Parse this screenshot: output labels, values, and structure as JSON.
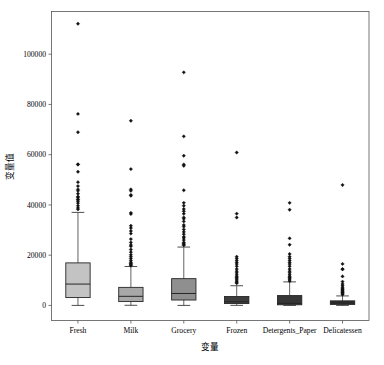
{
  "chart_data": {
    "type": "box",
    "title": "",
    "xlabel": "变量",
    "ylabel": "变量值",
    "grid": false,
    "legend": "none",
    "ylim": [
      -6000,
      117000
    ],
    "yticks": [
      0,
      20000,
      40000,
      60000,
      80000,
      100000
    ],
    "ytick_labels": [
      "0",
      "20000",
      "40000",
      "60000",
      "80000",
      "100000"
    ],
    "categories": [
      "Fresh",
      "Milk",
      "Grocery",
      "Frozen",
      "Detergents_Paper",
      "Delicatessen"
    ],
    "boxes": [
      {
        "name": "Fresh",
        "fill": "#c3c3c3",
        "whisker_low": 3,
        "q1": 3128,
        "median": 8504,
        "q3": 16934,
        "whisker_high": 37036,
        "fliers": [
          112151,
          76237,
          68951,
          56083,
          56159,
          53205,
          49063,
          47493,
          46197,
          45640,
          44466,
          43265,
          43088,
          42312,
          42088,
          41474,
          40721,
          39679,
          38793,
          38228
        ]
      },
      {
        "name": "Milk",
        "fill": "#a8a8a8",
        "whisker_low": 55,
        "q1": 1533,
        "median": 3627,
        "q3": 7190,
        "whisker_high": 15488,
        "fliers": [
          73498,
          54259,
          46197,
          45640,
          43950,
          43687,
          36423,
          36847,
          31714,
          30810,
          29627,
          28599,
          26400,
          25071,
          24025,
          23527,
          22272,
          21217,
          20170,
          19410,
          18664,
          17866,
          17160,
          16729,
          16448,
          16117,
          15828
        ]
      },
      {
        "name": "Grocery",
        "fill": "#8f8f8f",
        "whisker_low": 3,
        "q1": 2153,
        "median": 4756,
        "q3": 10656,
        "whisker_high": 23234,
        "fliers": [
          92780,
          67298,
          59598,
          55571,
          56082,
          45828,
          40827,
          39694,
          38369,
          37504,
          36486,
          35009,
          34454,
          33454,
          32034,
          31354,
          30243,
          29271,
          28373,
          27332,
          26839,
          25998,
          25071,
          24742,
          24231,
          23919
        ]
      },
      {
        "name": "Frozen",
        "fill": "#3d3d3d",
        "whisker_low": 25,
        "q1": 742,
        "median": 1526,
        "q3": 3554,
        "whisker_high": 7834,
        "fliers": [
          60869,
          36534,
          35009,
          19410,
          18711,
          17866,
          17120,
          16451,
          15601,
          14472,
          13644,
          12973,
          12212,
          11559,
          11093,
          10645,
          10155,
          9664,
          9165,
          8853
        ]
      },
      {
        "name": "Detergents_Paper",
        "fill": "#363636",
        "whisker_low": 3,
        "q1": 256,
        "median": 816,
        "q3": 3922,
        "whisker_high": 9371,
        "fliers": [
          40827,
          38102,
          26701,
          24171,
          20484,
          19410,
          18711,
          17866,
          17120,
          16451,
          15601,
          14472,
          13644,
          12973,
          12212,
          11559,
          11093,
          10645,
          10155,
          9664
        ]
      },
      {
        "name": "Delicatessen",
        "fill": "#2e2e2e",
        "whisker_low": 3,
        "q1": 408,
        "median": 965,
        "q3": 1820,
        "whisker_high": 3780,
        "fliers": [
          47943,
          16523,
          14472,
          14351,
          11559,
          9465,
          8550,
          7844,
          7204,
          6707,
          6372,
          5966,
          5609,
          5249,
          4946,
          4603,
          4293
        ]
      }
    ]
  }
}
